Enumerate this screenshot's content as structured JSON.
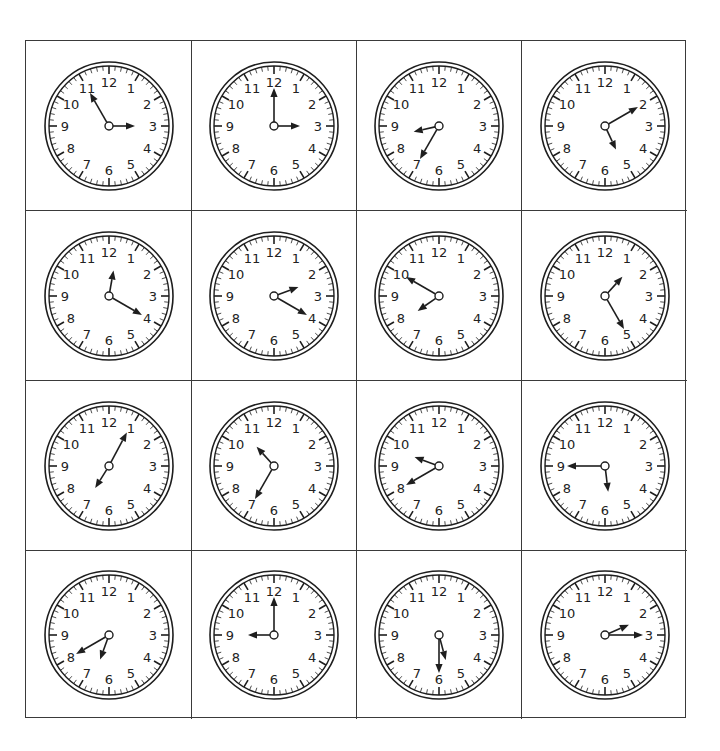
{
  "worksheet": {
    "numerals": [
      "12",
      "1",
      "2",
      "3",
      "4",
      "5",
      "6",
      "7",
      "8",
      "9",
      "10",
      "11"
    ],
    "colors": {
      "ink": "#1e1e1e",
      "border": "#3a3a3a",
      "background": "#ffffff"
    },
    "clocks": [
      {
        "row": 1,
        "col": 1,
        "hour_hand_points_to": "3",
        "minute_hand_points_to": "11",
        "time": "2:55"
      },
      {
        "row": 1,
        "col": 2,
        "hour_hand_points_to": "3",
        "minute_hand_points_to": "12",
        "time": "3:00"
      },
      {
        "row": 1,
        "col": 3,
        "hour_hand_points_to": "8-9",
        "minute_hand_points_to": "7",
        "time": "8:35"
      },
      {
        "row": 1,
        "col": 4,
        "hour_hand_points_to": "5",
        "minute_hand_points_to": "2",
        "time": "5:10"
      },
      {
        "row": 2,
        "col": 1,
        "hour_hand_points_to": "12",
        "minute_hand_points_to": "4",
        "time": "12:20"
      },
      {
        "row": 2,
        "col": 2,
        "hour_hand_points_to": "2",
        "minute_hand_points_to": "4",
        "time": "2:20"
      },
      {
        "row": 2,
        "col": 3,
        "hour_hand_points_to": "7-8",
        "minute_hand_points_to": "10",
        "time": "7:50"
      },
      {
        "row": 2,
        "col": 4,
        "hour_hand_points_to": "1",
        "minute_hand_points_to": "5",
        "time": "1:25"
      },
      {
        "row": 3,
        "col": 1,
        "hour_hand_points_to": "7",
        "minute_hand_points_to": "1",
        "time": "7:05"
      },
      {
        "row": 3,
        "col": 2,
        "hour_hand_points_to": "10-11",
        "minute_hand_points_to": "7",
        "time": "10:35"
      },
      {
        "row": 3,
        "col": 3,
        "hour_hand_points_to": "9-10",
        "minute_hand_points_to": "8",
        "time": "9:40"
      },
      {
        "row": 3,
        "col": 4,
        "hour_hand_points_to": "5-6",
        "minute_hand_points_to": "9",
        "time": "5:45"
      },
      {
        "row": 4,
        "col": 1,
        "hour_hand_points_to": "6-7",
        "minute_hand_points_to": "8",
        "time": "6:40"
      },
      {
        "row": 4,
        "col": 2,
        "hour_hand_points_to": "9",
        "minute_hand_points_to": "12",
        "time": "9:00"
      },
      {
        "row": 4,
        "col": 3,
        "hour_hand_points_to": "5-6",
        "minute_hand_points_to": "6",
        "time": "5:30"
      },
      {
        "row": 4,
        "col": 4,
        "hour_hand_points_to": "2",
        "minute_hand_points_to": "3",
        "time": "2:15"
      }
    ],
    "hand_angles_deg": [
      {
        "hour": 90,
        "minute": 330
      },
      {
        "hour": 90,
        "minute": 0
      },
      {
        "hour": 257,
        "minute": 210
      },
      {
        "hour": 155,
        "minute": 60
      },
      {
        "hour": 10,
        "minute": 120
      },
      {
        "hour": 70,
        "minute": 120
      },
      {
        "hour": 235,
        "minute": 300
      },
      {
        "hour": 42,
        "minute": 150
      },
      {
        "hour": 212,
        "minute": 28
      },
      {
        "hour": 318,
        "minute": 210
      },
      {
        "hour": 290,
        "minute": 240
      },
      {
        "hour": 173,
        "minute": 270
      },
      {
        "hour": 200,
        "minute": 240
      },
      {
        "hour": 270,
        "minute": 0
      },
      {
        "hour": 165,
        "minute": 180
      },
      {
        "hour": 67,
        "minute": 90
      }
    ]
  }
}
